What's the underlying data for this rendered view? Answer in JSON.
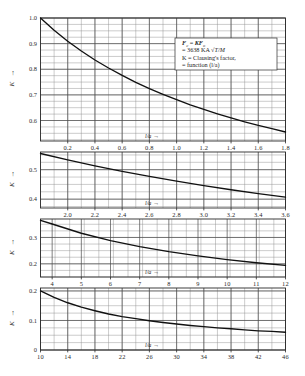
{
  "figure": {
    "name": "clausings-factor-chart",
    "y_axis_symbol": "K",
    "axis_title": "l/a",
    "axis_title_arrow": "→",
    "y_arrow": "↑"
  },
  "annotation": {
    "name": "formula-note",
    "lines": [
      "Fₑ = KFₒ",
      "= 3638 KA √T/M",
      "K = Clausing's factor,",
      "= function (l/a)"
    ],
    "line1_lhs": "F",
    "line1_sub": "c",
    "line1_eq": " = ",
    "line1_rhs": "KF",
    "line1_rhs_sub": "o",
    "line2": "= 3638 KA ",
    "line2_sqrt": "√",
    "line2_tail": "T/M",
    "line3": "K = Clausing's factor,",
    "line4": "= function (l/a)"
  },
  "chart_data": {
    "type": "line",
    "xlabel": "l/a",
    "ylabel": "K",
    "grid": true,
    "legend": false,
    "panels": [
      {
        "index": 1,
        "xlim": [
          0.0,
          1.8
        ],
        "ylim": [
          0.52,
          1.0
        ],
        "xticks": [
          0.2,
          0.4,
          0.6,
          0.8,
          1.0,
          1.2,
          1.4,
          1.6,
          1.8
        ],
        "xtick_labels": [
          "0.2",
          "0.4",
          "0.6",
          "0.8",
          "1.0",
          "1.2",
          "1.4",
          "1.6",
          "1.8"
        ],
        "yticks": [
          0.6,
          0.7,
          0.8,
          0.9,
          1.0
        ],
        "ytick_labels": [
          "0.6",
          "0.7",
          "0.8",
          "0.9",
          "1.0"
        ],
        "ylabel_shown": [
          "1.0",
          "0.9",
          "0.8",
          "0.7",
          "0.6"
        ],
        "xminor_step": 0.1,
        "yminor_step": 0.025,
        "x": [
          0.0,
          0.1,
          0.2,
          0.3,
          0.4,
          0.5,
          0.6,
          0.7,
          0.8,
          0.9,
          1.0,
          1.1,
          1.2,
          1.3,
          1.4,
          1.5,
          1.6,
          1.7,
          1.8
        ],
        "y": [
          1.0,
          0.952,
          0.909,
          0.871,
          0.836,
          0.805,
          0.776,
          0.749,
          0.724,
          0.702,
          0.681,
          0.661,
          0.643,
          0.626,
          0.61,
          0.595,
          0.581,
          0.568,
          0.555
        ]
      },
      {
        "index": 2,
        "xlim": [
          1.8,
          3.6
        ],
        "ylim": [
          0.37,
          0.56
        ],
        "xticks": [
          2.0,
          2.2,
          2.4,
          2.6,
          2.8,
          3.0,
          3.2,
          3.4,
          3.6
        ],
        "xtick_labels": [
          "2.0",
          "2.2",
          "2.4",
          "2.6",
          "2.8",
          "3.0",
          "3.2",
          "3.4",
          "3.6"
        ],
        "yticks": [
          0.4,
          0.5
        ],
        "ytick_labels": [
          "0.4",
          "0.5"
        ],
        "ylabel_shown": [
          "0.5",
          "0.4"
        ],
        "xminor_step": 0.1,
        "yminor_step": 0.025,
        "x": [
          1.8,
          2.0,
          2.2,
          2.4,
          2.6,
          2.8,
          3.0,
          3.2,
          3.4,
          3.6
        ],
        "y": [
          0.555,
          0.533,
          0.513,
          0.494,
          0.477,
          0.461,
          0.446,
          0.432,
          0.419,
          0.407
        ]
      },
      {
        "index": 3,
        "xlim": [
          3.6,
          12.0
        ],
        "ylim": [
          0.15,
          0.37
        ],
        "xticks": [
          4,
          5,
          6,
          7,
          8,
          9,
          10,
          11,
          12
        ],
        "xtick_labels": [
          "4",
          "5",
          "6",
          "7",
          "8",
          "9",
          "10",
          "11",
          "12"
        ],
        "yticks": [
          0.2,
          0.3
        ],
        "ytick_labels": [
          "0.2",
          "0.3"
        ],
        "ylabel_shown": [
          "0.3",
          "0.2"
        ],
        "xminor_step": 0.5,
        "yminor_step": 0.025,
        "x": [
          3.6,
          4,
          5,
          6,
          7,
          8,
          9,
          10,
          11,
          12
        ],
        "y": [
          0.365,
          0.351,
          0.316,
          0.288,
          0.265,
          0.246,
          0.23,
          0.216,
          0.204,
          0.194
        ]
      },
      {
        "index": 4,
        "xlim": [
          10.0,
          46.0
        ],
        "ylim": [
          0.0,
          0.21
        ],
        "xticks": [
          10,
          14,
          18,
          22,
          26,
          30,
          34,
          38,
          42,
          46
        ],
        "xtick_labels": [
          "10",
          "14",
          "18",
          "22",
          "26",
          "30",
          "34",
          "38",
          "42",
          "46"
        ],
        "yticks": [
          0.0,
          0.1,
          0.2
        ],
        "ytick_labels": [
          "0",
          "0.1",
          "0.2"
        ],
        "ylabel_shown": [
          "0.2",
          "0.1",
          "0"
        ],
        "xminor_step": 2,
        "yminor_step": 0.025,
        "x": [
          10,
          12,
          14,
          16,
          18,
          20,
          22,
          24,
          26,
          28,
          30,
          32,
          34,
          36,
          38,
          40,
          42,
          44,
          46
        ],
        "y": [
          0.2,
          0.178,
          0.16,
          0.145,
          0.133,
          0.122,
          0.113,
          0.106,
          0.099,
          0.093,
          0.088,
          0.083,
          0.079,
          0.075,
          0.072,
          0.068,
          0.065,
          0.063,
          0.06
        ]
      }
    ]
  }
}
